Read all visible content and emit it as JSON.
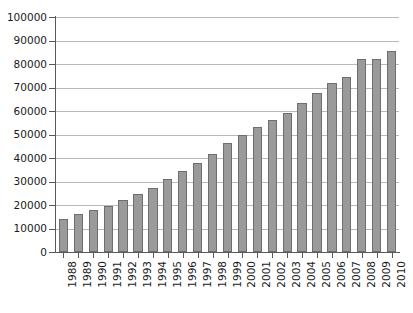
{
  "chart_data": {
    "type": "bar",
    "title": "",
    "subtitle": "",
    "xlabel": "",
    "ylabel": "",
    "categories": [
      "1988",
      "1989",
      "1990",
      "1991",
      "1992",
      "1993",
      "1994",
      "1995",
      "1996",
      "1997",
      "1998",
      "1999",
      "2000",
      "2001",
      "2002",
      "2003",
      "2004",
      "2005",
      "2006",
      "2007",
      "2008",
      "2009",
      "2010"
    ],
    "values": [
      14000,
      16100,
      17800,
      19400,
      22000,
      24600,
      27400,
      31000,
      34500,
      38000,
      41600,
      46200,
      50000,
      53400,
      56200,
      59000,
      63500,
      67500,
      72000,
      74500,
      82000,
      82000,
      85700
    ],
    "ylim": [
      0,
      100000
    ],
    "ytick_labels": [
      "0",
      "10000",
      "20000",
      "30000",
      "40000",
      "50000",
      "60000",
      "70000",
      "80000",
      "90000",
      "100000"
    ],
    "ytick_values": [
      0,
      10000,
      20000,
      30000,
      40000,
      50000,
      60000,
      70000,
      80000,
      90000,
      100000
    ],
    "grid": true,
    "grid_axis": "y",
    "legend": false,
    "legend_position": "none",
    "series": [
      {
        "name": "",
        "values": [
          14000,
          16100,
          17800,
          19400,
          22000,
          24600,
          27400,
          31000,
          34500,
          38000,
          41600,
          46200,
          50000,
          53400,
          56200,
          59000,
          63500,
          67500,
          72000,
          74500,
          82000,
          82000,
          85700
        ]
      }
    ],
    "colors": {
      "bar_fill": "#9a9a9a",
      "bar_edge": "#6e6e6e",
      "gridline": "#b9b9b9",
      "axis": "#595959",
      "background": "#ffffff",
      "text": "#1a1a1a"
    }
  }
}
